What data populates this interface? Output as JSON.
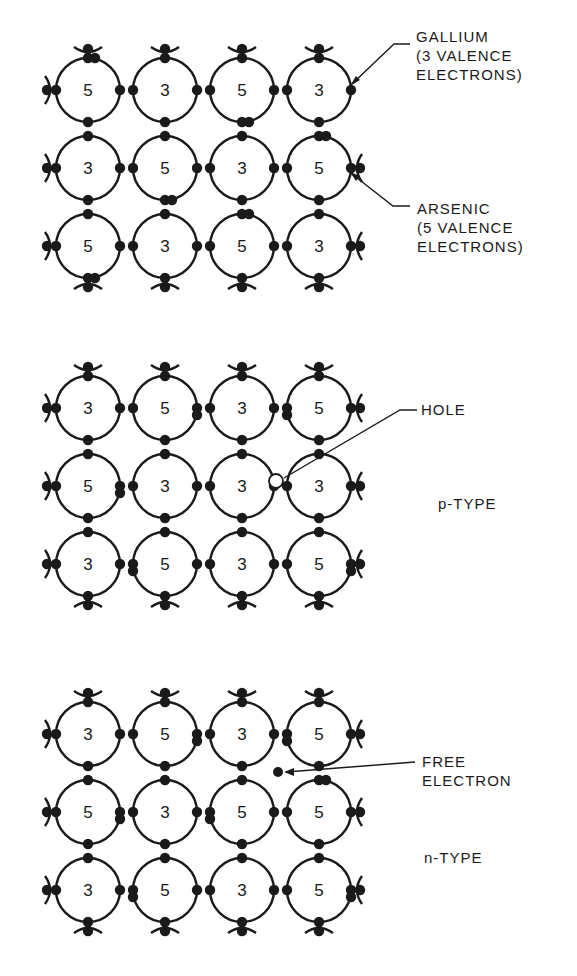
{
  "colors": {
    "ink": "#1a1a1a",
    "background": "#ffffff",
    "hole_fill": "#ffffff"
  },
  "panels": [
    {
      "id": "intrinsic",
      "origin": {
        "x": 88,
        "y": 90
      },
      "rows": [
        [
          "5",
          "3",
          "5",
          "3"
        ],
        [
          "3",
          "5",
          "3",
          "5"
        ],
        [
          "5",
          "3",
          "5",
          "3"
        ]
      ],
      "labels": [
        {
          "id": "gallium",
          "lines": [
            "GALLIUM",
            "(3 VALENCE",
            "ELECTRONS)"
          ],
          "x": 416,
          "y": 27
        },
        {
          "id": "arsenic",
          "lines": [
            "ARSENIC",
            "(5 VALENCE",
            "ELECTRONS)"
          ],
          "x": 417,
          "y": 199
        }
      ]
    },
    {
      "id": "p-type",
      "origin": {
        "x": 88,
        "y": 408
      },
      "rows": [
        [
          "3",
          "5",
          "3",
          "5"
        ],
        [
          "5",
          "3",
          "3",
          "3"
        ],
        [
          "3",
          "5",
          "3",
          "5"
        ]
      ],
      "labels": [
        {
          "id": "hole",
          "lines": [
            "HOLE"
          ],
          "x": 421,
          "y": 400
        },
        {
          "id": "p-type-title",
          "lines": [
            "p-TYPE"
          ],
          "x": 438,
          "y": 494
        }
      ]
    },
    {
      "id": "n-type",
      "origin": {
        "x": 88,
        "y": 734
      },
      "rows": [
        [
          "3",
          "5",
          "3",
          "5"
        ],
        [
          "5",
          "3",
          "5",
          "5"
        ],
        [
          "3",
          "5",
          "3",
          "5"
        ]
      ],
      "labels": [
        {
          "id": "free-electron",
          "lines": [
            "FREE",
            "ELECTRON"
          ],
          "x": 422,
          "y": 752
        },
        {
          "id": "n-type-title",
          "lines": [
            "n-TYPE"
          ],
          "x": 424,
          "y": 848
        }
      ]
    }
  ],
  "annotations": {
    "hole": {
      "cx": 276,
      "cy": 481,
      "r": 7
    },
    "free_electron": {
      "cx": 278,
      "cy": 772,
      "r": 5
    }
  }
}
